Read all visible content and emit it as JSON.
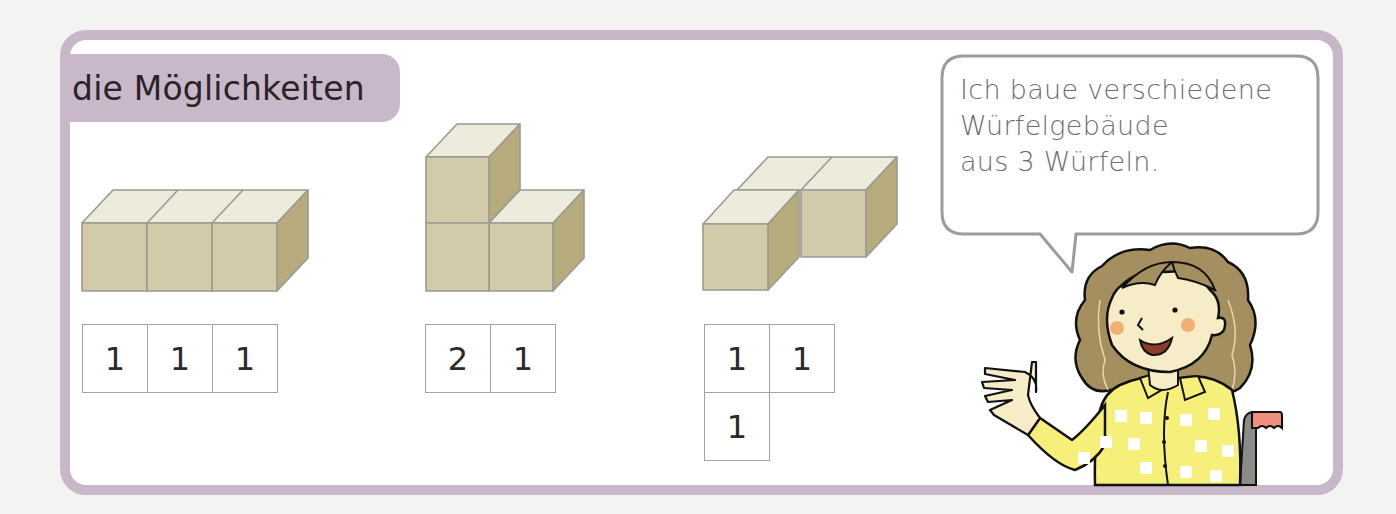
{
  "section": {
    "title": "die Möglichkeiten"
  },
  "speech_bubble": {
    "lines": [
      "Ich baue verschiedene",
      "Würfelgebäude",
      "aus 3 Würfeln."
    ]
  },
  "buildings": [
    {
      "name": "row-of-three",
      "plan": [
        [
          "1",
          "1",
          "1"
        ]
      ]
    },
    {
      "name": "tower-and-one",
      "plan": [
        [
          "2",
          "1"
        ]
      ]
    },
    {
      "name": "l-shape",
      "plan": [
        [
          "1",
          "1"
        ],
        [
          "1",
          ""
        ]
      ]
    }
  ],
  "colors": {
    "frame": "#c8b7c9",
    "title_tab": "#c9b8c9",
    "cube_top": "#ecebdc",
    "cube_front": "#d3caa9",
    "cube_side": "#b7ab7e",
    "cube_edge": "#9a9a93",
    "bubble_border": "#9c9c9c",
    "bubble_text": "#6a6e71",
    "hair": "#a58f60",
    "skin": "#f7ecc8",
    "shirt": "#f6f07a",
    "cheek": "#f0a86a"
  },
  "character": {
    "description": "girl with curly hair in yellow checkered shirt, waving, sitting in a wheelchair"
  }
}
